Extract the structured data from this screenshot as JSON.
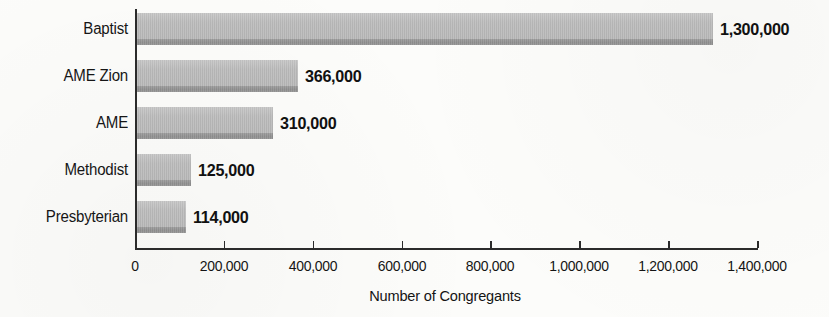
{
  "chart_data": {
    "type": "bar",
    "orientation": "horizontal",
    "title": "",
    "xlabel": "Number of Congregants",
    "ylabel": "",
    "categories": [
      "Baptist",
      "AME Zion",
      "AME",
      "Methodist",
      "Presbyterian"
    ],
    "values": [
      1300000,
      366000,
      310000,
      125000,
      114000
    ],
    "value_labels": [
      "1,300,000",
      "366,000",
      "310,000",
      "125,000",
      "114,000"
    ],
    "xlim": [
      0,
      1400000
    ],
    "xticks": [
      0,
      200000,
      400000,
      600000,
      800000,
      1000000,
      1200000,
      1400000
    ],
    "xtick_labels": [
      "0",
      "200,000",
      "400,000",
      "600,000",
      "800,000",
      "1,000,000",
      "1,200,000",
      "1,400,000"
    ],
    "grid": false,
    "legend": null,
    "colors": {
      "bar_fill": "#b6b6b6",
      "bar_stripe": "#8d8d8d",
      "axis": "#2b2b2b",
      "text": "#141414",
      "background": "#fcfcfa"
    }
  },
  "layout": {
    "plot_left": 135,
    "plot_right": 757,
    "axis_y": 248,
    "row_pitch": 47,
    "first_bar_top": 13,
    "bar_height": 32,
    "label_gap": 7,
    "tick_len": 7,
    "tick_label_y": 258,
    "axis_title_y": 288,
    "axis_title_center_x": 445
  }
}
